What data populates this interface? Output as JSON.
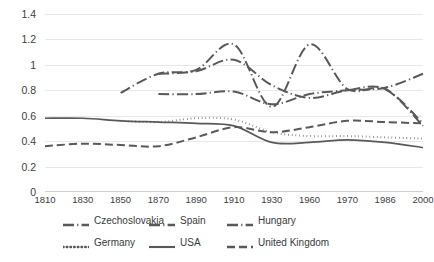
{
  "chart_data": {
    "type": "line",
    "title": "",
    "xlabel": "",
    "ylabel": "",
    "ylim": [
      0,
      1.4
    ],
    "grid": true,
    "legend_position": "bottom",
    "x_tick_labels": [
      "1810",
      "1830",
      "1850",
      "1870",
      "1890",
      "1910",
      "1930",
      "1960",
      "1970",
      "1986",
      "2000"
    ],
    "y_tick_labels": [
      "0",
      "0.2",
      "0.4",
      "0.6",
      "0.8",
      "1",
      "1.2",
      "1.4"
    ],
    "y_tick_values": [
      0,
      0.2,
      0.4,
      0.6,
      0.8,
      1,
      1.2,
      1.4
    ],
    "line_color": "#595959",
    "gridline_color": "#e8e8e8",
    "series": [
      {
        "name": "Czechoslovakia",
        "style": "dash-dot",
        "x": [
          "1850",
          "1870",
          "1890",
          "1910",
          "1930",
          "1960",
          "1970",
          "1986",
          "2000"
        ],
        "values": [
          null,
          0.77,
          0.77,
          0.79,
          0.69,
          0.77,
          0.8,
          0.82,
          0.93
        ]
      },
      {
        "name": "Spain",
        "style": "dash-dot",
        "x": [
          "1850",
          "1870",
          "1890",
          "1910",
          "1930",
          "1960",
          "1970",
          "1986",
          "2000"
        ],
        "values": [
          0.78,
          0.93,
          0.96,
          1.16,
          0.67,
          1.16,
          0.81,
          0.81,
          0.54
        ]
      },
      {
        "name": "Hungary",
        "style": "dash-dot",
        "x": [
          "1850",
          "1870",
          "1890",
          "1910",
          "1930",
          "1960",
          "1970",
          "1986",
          "2000"
        ],
        "values": [
          null,
          0.93,
          0.95,
          1.04,
          0.84,
          0.74,
          0.8,
          0.81,
          0.52
        ]
      },
      {
        "name": "Germany",
        "style": "dotted",
        "x": [
          "1850",
          "1870",
          "1890",
          "1910",
          "1930",
          "1960",
          "1970",
          "1986",
          "2000"
        ],
        "values": [
          0.56,
          0.55,
          0.58,
          0.57,
          0.47,
          0.44,
          0.44,
          0.43,
          0.42
        ]
      },
      {
        "name": "USA",
        "style": "solid",
        "x": [
          "1810",
          "1830",
          "1850",
          "1870",
          "1890",
          "1910",
          "1930",
          "1960",
          "1970",
          "1986",
          "2000"
        ],
        "values": [
          0.58,
          0.58,
          0.56,
          0.55,
          0.54,
          0.52,
          0.39,
          0.39,
          0.41,
          0.39,
          0.35
        ]
      },
      {
        "name": "United Kingdom",
        "style": "dashed",
        "x": [
          "1810",
          "1830",
          "1850",
          "1870",
          "1890",
          "1910",
          "1930",
          "1960",
          "1970",
          "1986",
          "2000"
        ],
        "values": [
          0.36,
          0.38,
          0.37,
          0.36,
          0.43,
          0.51,
          0.47,
          0.51,
          0.56,
          0.55,
          0.54
        ]
      }
    ]
  },
  "legend": {
    "row1": [
      {
        "label": "Czechoslovakia",
        "style": "dash-dot"
      },
      {
        "label": "Spain",
        "style": "dash-dot"
      },
      {
        "label": "Hungary",
        "style": "dash-dot"
      }
    ],
    "row2": [
      {
        "label": "Germany",
        "style": "dotted"
      },
      {
        "label": "USA",
        "style": "solid"
      },
      {
        "label": "United Kingdom",
        "style": "dashed"
      }
    ]
  }
}
